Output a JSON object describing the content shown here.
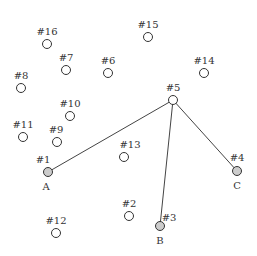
{
  "diagram": {
    "type": "network-node-graph",
    "background": "#ffffff",
    "colors": {
      "node_stroke": "#333333",
      "node_fill_plain": "#ffffff",
      "node_fill_highlighted": "#cccccc",
      "edge": "#444444",
      "text": "#333333"
    },
    "nodes": [
      {
        "id": "#1",
        "label": "#1",
        "x": 48,
        "y": 172,
        "highlighted": true,
        "letter": "A"
      },
      {
        "id": "#2",
        "label": "#2",
        "x": 129,
        "y": 216,
        "highlighted": false,
        "letter": ""
      },
      {
        "id": "#3",
        "label": "#3",
        "x": 160,
        "y": 226,
        "highlighted": true,
        "letter": "B"
      },
      {
        "id": "#4",
        "label": "#4",
        "x": 237,
        "y": 171,
        "highlighted": true,
        "letter": "C"
      },
      {
        "id": "#5",
        "label": "#5",
        "x": 173,
        "y": 100,
        "highlighted": false,
        "letter": ""
      },
      {
        "id": "#6",
        "label": "#6",
        "x": 108,
        "y": 73,
        "highlighted": false,
        "letter": ""
      },
      {
        "id": "#7",
        "label": "#7",
        "x": 66,
        "y": 70,
        "highlighted": false,
        "letter": ""
      },
      {
        "id": "#8",
        "label": "#8",
        "x": 21,
        "y": 88,
        "highlighted": false,
        "letter": ""
      },
      {
        "id": "#9",
        "label": "#9",
        "x": 57,
        "y": 142,
        "highlighted": false,
        "letter": ""
      },
      {
        "id": "#10",
        "label": "#10",
        "x": 70,
        "y": 116,
        "highlighted": false,
        "letter": ""
      },
      {
        "id": "#11",
        "label": "#11",
        "x": 23,
        "y": 137,
        "highlighted": false,
        "letter": ""
      },
      {
        "id": "#12",
        "label": "#12",
        "x": 56,
        "y": 233,
        "highlighted": false,
        "letter": ""
      },
      {
        "id": "#13",
        "label": "#13",
        "x": 124,
        "y": 157,
        "highlighted": false,
        "letter": ""
      },
      {
        "id": "#14",
        "label": "#14",
        "x": 204,
        "y": 73,
        "highlighted": false,
        "letter": ""
      },
      {
        "id": "#15",
        "label": "#15",
        "x": 148,
        "y": 37,
        "highlighted": false,
        "letter": ""
      },
      {
        "id": "#16",
        "label": "#16",
        "x": 47,
        "y": 44,
        "highlighted": false,
        "letter": ""
      }
    ],
    "edges": [
      {
        "from": "#5",
        "to": "#1"
      },
      {
        "from": "#5",
        "to": "#3"
      },
      {
        "from": "#5",
        "to": "#4"
      }
    ],
    "node_radius": 4.5
  }
}
